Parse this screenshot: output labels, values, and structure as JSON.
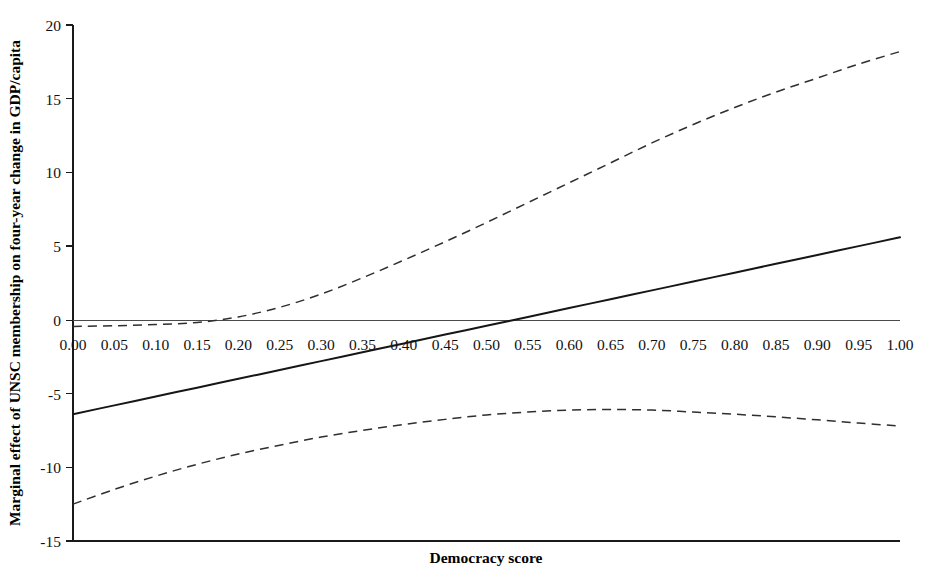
{
  "chart_data": {
    "type": "line",
    "title": "",
    "xlabel": "Democracy score",
    "ylabel": "Marginal effect of UNSC membership on four-year change in GDP/capita",
    "xlim": [
      0.0,
      1.0
    ],
    "ylim": [
      -15,
      20
    ],
    "grid": false,
    "legend": "none",
    "xticks": [
      "0.00",
      "0.05",
      "0.10",
      "0.15",
      "0.20",
      "0.25",
      "0.30",
      "0.35",
      "0.40",
      "0.45",
      "0.50",
      "0.55",
      "0.60",
      "0.65",
      "0.70",
      "0.75",
      "0.80",
      "0.85",
      "0.90",
      "0.95",
      "1.00"
    ],
    "xtick_values": [
      0.0,
      0.05,
      0.1,
      0.15,
      0.2,
      0.25,
      0.3,
      0.35,
      0.4,
      0.45,
      0.5,
      0.55,
      0.6,
      0.65,
      0.7,
      0.75,
      0.8,
      0.85,
      0.9,
      0.95,
      1.0
    ],
    "yticks": [
      "20",
      "15",
      "10",
      "5",
      "0",
      "-5",
      "-10",
      "-15"
    ],
    "ytick_values": [
      20,
      15,
      10,
      5,
      0,
      -5,
      -10,
      -15
    ],
    "zero_reference_line": 0,
    "x": [
      0.0,
      0.05,
      0.1,
      0.15,
      0.2,
      0.25,
      0.3,
      0.35,
      0.4,
      0.45,
      0.5,
      0.55,
      0.6,
      0.65,
      0.7,
      0.75,
      0.8,
      0.85,
      0.9,
      0.95,
      1.0
    ],
    "series": [
      {
        "name": "Marginal effect (point estimate)",
        "style": "solid",
        "values": [
          -6.4,
          -5.8,
          -5.2,
          -4.6,
          -4.0,
          -3.4,
          -2.8,
          -2.2,
          -1.6,
          -1.0,
          -0.4,
          0.2,
          0.8,
          1.4,
          2.0,
          2.6,
          3.2,
          3.8,
          4.4,
          5.0,
          5.6
        ]
      },
      {
        "name": "Upper 95% confidence bound",
        "style": "dashed",
        "values": [
          -0.45,
          -0.4,
          -0.32,
          -0.18,
          0.2,
          0.85,
          1.75,
          2.85,
          4.05,
          5.3,
          6.6,
          7.95,
          9.3,
          10.65,
          12.0,
          13.25,
          14.4,
          15.45,
          16.4,
          17.35,
          18.2
        ]
      },
      {
        "name": "Lower 95% confidence bound",
        "style": "dashed",
        "values": [
          -12.5,
          -11.5,
          -10.6,
          -9.8,
          -9.1,
          -8.5,
          -7.95,
          -7.5,
          -7.1,
          -6.75,
          -6.45,
          -6.25,
          -6.12,
          -6.08,
          -6.12,
          -6.25,
          -6.4,
          -6.58,
          -6.78,
          -7.0,
          -7.2
        ]
      }
    ],
    "crossings": {
      "solid_crosses_zero_at": 0.545,
      "upper_bound_crosses_zero_at": 0.155
    }
  }
}
